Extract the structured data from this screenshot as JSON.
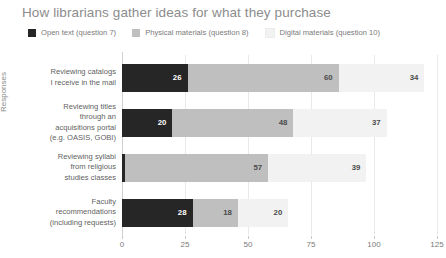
{
  "chart_data": {
    "type": "bar",
    "orientation": "horizontal",
    "stacked": true,
    "title": "How librarians gather ideas for what they purchase",
    "xlabel": "",
    "ylabel": "Responses",
    "xlim": [
      0,
      125
    ],
    "xticks": [
      0,
      25,
      50,
      75,
      100,
      125
    ],
    "grid": true,
    "legend_position": "top-left",
    "categories": [
      "Reviewing catalogs\nI receive in the mail",
      "Reviewing titles\nthrough an\nacquisitions portal\n(e.g. OASIS, GOBI)",
      "Reviewing syllabi\nfrom religious\nstudies classes",
      "Faculty\nrecommendations\n(including requests)"
    ],
    "series": [
      {
        "name": "Open text (question 7)",
        "color": "#262626",
        "values": [
          26,
          20,
          1,
          28
        ]
      },
      {
        "name": "Physical materials (question 8)",
        "color": "#bfbfbf",
        "values": [
          60,
          48,
          57,
          18
        ]
      },
      {
        "name": "Digital materials (question 10)",
        "color": "#f2f2f2",
        "values": [
          34,
          37,
          39,
          20
        ]
      }
    ]
  },
  "colors": {
    "title": "#8c8c8c",
    "tick": "#7a7a7a",
    "grid": "#e9e9e9",
    "axis": "#d0d0d0",
    "background": "#ffffff"
  }
}
